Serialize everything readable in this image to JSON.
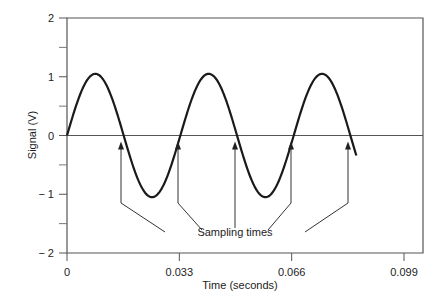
{
  "chart_data": {
    "type": "line",
    "title": "",
    "xlabel": "Time (seconds)",
    "ylabel": "Signal (V)",
    "xlim": [
      0,
      0.099
    ],
    "ylim": [
      -2,
      2
    ],
    "x_ticks": [
      0,
      0.033,
      0.066,
      0.099
    ],
    "x_tick_labels": [
      "0",
      "0.033",
      "0.066",
      "0.099"
    ],
    "y_ticks": [
      -2,
      -1,
      0,
      1,
      2
    ],
    "y_tick_labels": [
      "− 2",
      "− 1",
      "0",
      "1",
      "2"
    ],
    "y_minor_ticks": [
      -1.5,
      -0.5,
      0.5,
      1.5
    ],
    "grid": false,
    "legend": null,
    "series": [
      {
        "name": "Signal",
        "function": "sine",
        "amplitude": 1.05,
        "period_s": 0.0333,
        "frequency_hz": 30,
        "x_start": 0,
        "x_end": 0.085
      }
    ],
    "zero_line": true,
    "annotations": [
      {
        "text": "Sampling times",
        "arrow_targets_x": [
          0.0165,
          0.0333,
          0.05,
          0.0666,
          0.0833
        ],
        "arrow_target_y": 0
      }
    ]
  }
}
